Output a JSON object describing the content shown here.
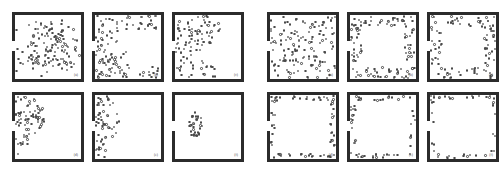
{
  "figure": {
    "background_color": "#ffffff",
    "wall_color": "#2b2b2b",
    "particle_color": "#4a4a4a",
    "group_count": 2,
    "panels_per_group": 6,
    "grid": {
      "rows": 2,
      "cols": 3
    }
  },
  "groups": [
    {
      "name": "left-group",
      "panels": [
        {
          "label": "(a)",
          "room": {
            "exit_side": "left",
            "exit_center_fraction": 0.44,
            "exit_width_fraction": 0.13
          },
          "particle_count": 140,
          "pattern": "dispersed-uniform-clusters",
          "seed": 11
        },
        {
          "label": "(b)",
          "room": {
            "exit_side": "left",
            "exit_center_fraction": 0.44,
            "exit_width_fraction": 0.13
          },
          "particle_count": 120,
          "pattern": "left-top-bottom-band",
          "seed": 22
        },
        {
          "label": "(c)",
          "room": {
            "exit_side": "left",
            "exit_center_fraction": 0.44,
            "exit_width_fraction": 0.13
          },
          "particle_count": 100,
          "pattern": "left-heavy-blob",
          "seed": 33
        },
        {
          "label": "(d)",
          "room": {
            "exit_side": "left",
            "exit_center_fraction": 0.44,
            "exit_width_fraction": 0.13
          },
          "particle_count": 78,
          "pattern": "left-column-blob",
          "seed": 44
        },
        {
          "label": "(e)",
          "room": {
            "exit_side": "left",
            "exit_center_fraction": 0.44,
            "exit_width_fraction": 0.13
          },
          "particle_count": 60,
          "pattern": "narrow-left-column",
          "seed": 55
        },
        {
          "label": "(f)",
          "room": {
            "exit_side": "left",
            "exit_center_fraction": 0.44,
            "exit_width_fraction": 0.13
          },
          "particle_count": 34,
          "pattern": "small-central-left-clump",
          "seed": 66
        }
      ]
    },
    {
      "name": "right-group",
      "panels": [
        {
          "label": "(a)",
          "room": {
            "exit_side": "left",
            "exit_center_fraction": 0.44,
            "exit_width_fraction": 0.13
          },
          "particle_count": 140,
          "pattern": "dispersed-uniform",
          "seed": 77
        },
        {
          "label": "(b)",
          "room": {
            "exit_side": "left",
            "exit_center_fraction": 0.44,
            "exit_width_fraction": 0.13
          },
          "particle_count": 120,
          "pattern": "thick-wall-ring",
          "seed": 88
        },
        {
          "label": "(c)",
          "room": {
            "exit_side": "left",
            "exit_center_fraction": 0.44,
            "exit_width_fraction": 0.13
          },
          "particle_count": 104,
          "pattern": "thick-wall-ring",
          "seed": 99
        },
        {
          "label": "(d)",
          "room": {
            "exit_side": "left",
            "exit_center_fraction": 0.44,
            "exit_width_fraction": 0.13
          },
          "particle_count": 74,
          "pattern": "single-layer-wall-ring",
          "seed": 111
        },
        {
          "label": "(e)",
          "room": {
            "exit_side": "left",
            "exit_center_fraction": 0.44,
            "exit_width_fraction": 0.13
          },
          "particle_count": 58,
          "pattern": "single-layer-wall-ring",
          "seed": 122
        },
        {
          "label": "(f)",
          "room": {
            "exit_side": "left",
            "exit_center_fraction": 0.44,
            "exit_width_fraction": 0.13
          },
          "particle_count": 46,
          "pattern": "sparse-wall-ring",
          "seed": 133
        }
      ]
    }
  ],
  "chart_data": {
    "type": "scatter",
    "xlabel": "",
    "ylabel": "",
    "xlim": [
      0,
      1
    ],
    "ylim": [
      0,
      1
    ],
    "grid": false,
    "legend": "none",
    "panels": [
      {
        "group": "left",
        "label": "(a)",
        "n": 140,
        "description": "particles spread throughout the room interior, loose clusters, moderate density everywhere"
      },
      {
        "group": "left",
        "label": "(b)",
        "n": 120,
        "description": "particles condensed along left wall and across top and bottom, hollow centre"
      },
      {
        "group": "left",
        "label": "(c)",
        "n": 100,
        "description": "dense blob occupying the left half, empty right half"
      },
      {
        "group": "left",
        "label": "(d)",
        "n": 78,
        "description": "vertical band hugging left wall around the exit"
      },
      {
        "group": "left",
        "label": "(e)",
        "n": 60,
        "description": "narrower vertical band near the left wall"
      },
      {
        "group": "left",
        "label": "(f)",
        "n": 34,
        "description": "small isolated clump left-of-centre, rest of room empty"
      },
      {
        "group": "right",
        "label": "(a)",
        "n": 140,
        "description": "uniform random dispersion over whole room"
      },
      {
        "group": "right",
        "label": "(b)",
        "n": 120,
        "description": "thick band of particles along all four walls, empty core"
      },
      {
        "group": "right",
        "label": "(c)",
        "n": 104,
        "description": "thick wall ring slightly thinner, empty core"
      },
      {
        "group": "right",
        "label": "(d)",
        "n": 74,
        "description": "single-file ring of particles touching the walls"
      },
      {
        "group": "right",
        "label": "(e)",
        "n": 58,
        "description": "sparser single-file ring along walls"
      },
      {
        "group": "right",
        "label": "(f)",
        "n": 46,
        "description": "sparsest single-file ring, mostly top and bottom walls"
      }
    ]
  }
}
